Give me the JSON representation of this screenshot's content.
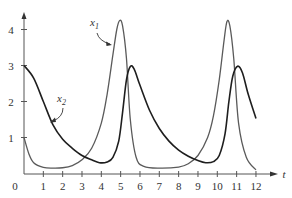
{
  "chart_data": {
    "type": "line",
    "title": "",
    "xlabel": "t",
    "ylabel": "",
    "xlim": [
      0,
      12
    ],
    "ylim": [
      0,
      4.3
    ],
    "x_ticks": [
      0,
      1,
      2,
      3,
      4,
      5,
      6,
      7,
      8,
      9,
      10,
      11,
      12
    ],
    "y_ticks": [
      1,
      2,
      3,
      4
    ],
    "grid": false,
    "legend": "inline annotations with arrows",
    "series": [
      {
        "name": "x1",
        "label_main": "x",
        "label_sub": "1",
        "color": "#5a5a5a",
        "x": [
          0,
          0.25,
          0.5,
          1,
          1.5,
          2,
          2.5,
          3,
          3.5,
          4,
          4.3,
          4.6,
          4.8,
          4.95,
          5.1,
          5.3,
          5.5,
          5.8,
          6.2,
          7,
          8,
          8.5,
          9,
          9.5,
          9.8,
          10.1,
          10.35,
          10.5,
          10.65,
          10.85,
          11.1,
          11.5,
          12
        ],
        "y": [
          1.0,
          0.55,
          0.3,
          0.17,
          0.15,
          0.16,
          0.22,
          0.38,
          0.7,
          1.4,
          2.2,
          3.3,
          4.0,
          4.25,
          4.1,
          3.2,
          1.5,
          0.45,
          0.2,
          0.15,
          0.18,
          0.27,
          0.5,
          1.0,
          1.6,
          2.6,
          3.7,
          4.22,
          4.1,
          3.2,
          1.4,
          0.45,
          0.1
        ]
      },
      {
        "name": "x2",
        "label_main": "x",
        "label_sub": "2",
        "color": "#1e1e1e",
        "x": [
          0,
          0.5,
          1,
          1.5,
          2,
          2.5,
          3,
          3.5,
          3.9,
          4.3,
          4.6,
          4.9,
          5.1,
          5.3,
          5.5,
          5.7,
          6,
          6.5,
          7,
          7.5,
          8,
          8.5,
          9,
          9.4,
          9.8,
          10.1,
          10.4,
          10.6,
          10.8,
          11.05,
          11.3,
          11.6,
          12
        ],
        "y": [
          3.0,
          2.65,
          2.0,
          1.35,
          0.95,
          0.7,
          0.5,
          0.38,
          0.3,
          0.32,
          0.45,
          0.9,
          1.7,
          2.6,
          2.97,
          2.9,
          2.45,
          1.75,
          1.25,
          0.9,
          0.65,
          0.48,
          0.36,
          0.3,
          0.33,
          0.5,
          1.1,
          2.0,
          2.7,
          2.98,
          2.8,
          2.2,
          1.53
        ]
      }
    ],
    "annotations": [
      {
        "text": "x1",
        "points_to_series": "x1",
        "label_t": 4.0,
        "label_y": 4.0
      },
      {
        "text": "x2",
        "points_to_series": "x2",
        "label_t": 1.85,
        "label_y": 2.0
      }
    ]
  },
  "labels": {
    "t_axis": "t",
    "origin": "0",
    "x1_main": "x",
    "x1_sub": "1",
    "x2_main": "x",
    "x2_sub": "2"
  }
}
